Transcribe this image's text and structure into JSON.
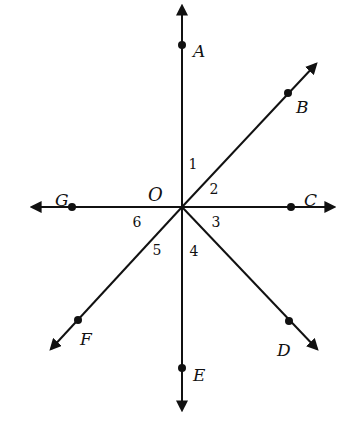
{
  "diagram": {
    "title": "",
    "center": {
      "label": "O",
      "x": 182,
      "y": 207
    },
    "rays": [
      {
        "id": "OA",
        "point": "A",
        "px": 182,
        "py": 45,
        "ex": 182,
        "ey": 6,
        "lx": 193,
        "ly": 51
      },
      {
        "id": "OB",
        "point": "B",
        "px": 288,
        "py": 93,
        "ex": 316,
        "ey": 64,
        "lx": 296,
        "ly": 107
      },
      {
        "id": "OC",
        "point": "C",
        "px": 291,
        "py": 207,
        "ex": 334,
        "ey": 207,
        "lx": 304,
        "ly": 200
      },
      {
        "id": "OD",
        "point": "D",
        "px": 289,
        "py": 321,
        "ex": 317,
        "ey": 349,
        "lx": 277,
        "ly": 350
      },
      {
        "id": "OE",
        "point": "E",
        "px": 182,
        "py": 368,
        "ex": 182,
        "ey": 410,
        "lx": 193,
        "ly": 375
      },
      {
        "id": "OF",
        "point": "F",
        "px": 78,
        "py": 320,
        "ex": 51,
        "ey": 349,
        "lx": 80,
        "ly": 339
      },
      {
        "id": "OG",
        "point": "G",
        "px": 72,
        "py": 207,
        "ex": 32,
        "ey": 207,
        "lx": 55,
        "ly": 200
      }
    ],
    "angle_labels": [
      {
        "label": "1",
        "x": 193,
        "y": 169
      },
      {
        "label": "2",
        "x": 214,
        "y": 194
      },
      {
        "label": "3",
        "x": 216,
        "y": 227
      },
      {
        "label": "4",
        "x": 194,
        "y": 256
      },
      {
        "label": "5",
        "x": 157,
        "y": 255
      },
      {
        "label": "6",
        "x": 137,
        "y": 227
      }
    ],
    "center_label_pos": {
      "x": 148,
      "y": 201
    },
    "colors": {
      "stroke": "#111111",
      "background": "#ffffff"
    }
  }
}
